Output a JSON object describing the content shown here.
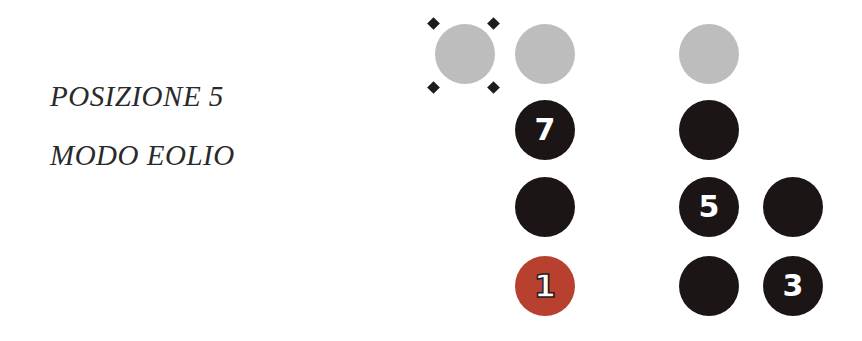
{
  "titles": {
    "position": "POSIZIONE 5",
    "mode": "MODO EOLIO"
  },
  "colors": {
    "open_string": "#bdbdbd",
    "note": "#1c1516",
    "root": "#b8402e",
    "label": "#ffffff",
    "text": "#2a2a2a"
  },
  "diagram": {
    "columns": 4,
    "rows": 4,
    "dots": [
      {
        "col": 1,
        "row": 1,
        "type": "open",
        "label": "",
        "marked": true
      },
      {
        "col": 2,
        "row": 1,
        "type": "open",
        "label": ""
      },
      {
        "col": 3,
        "row": 1,
        "type": "open",
        "label": ""
      },
      {
        "col": 2,
        "row": 2,
        "type": "note",
        "label": "7"
      },
      {
        "col": 3,
        "row": 2,
        "type": "note",
        "label": ""
      },
      {
        "col": 2,
        "row": 3,
        "type": "note",
        "label": ""
      },
      {
        "col": 3,
        "row": 3,
        "type": "note",
        "label": "5"
      },
      {
        "col": 4,
        "row": 3,
        "type": "note",
        "label": ""
      },
      {
        "col": 2,
        "row": 4,
        "type": "root",
        "label": "1"
      },
      {
        "col": 3,
        "row": 4,
        "type": "note",
        "label": ""
      },
      {
        "col": 4,
        "row": 4,
        "type": "note",
        "label": "3"
      }
    ]
  }
}
